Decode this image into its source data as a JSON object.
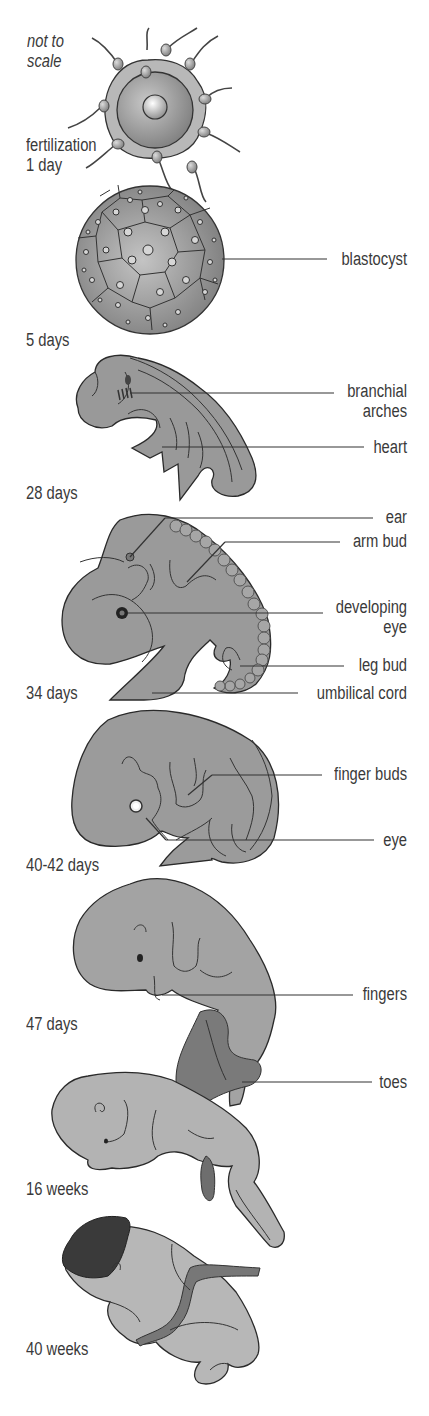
{
  "diagram": {
    "note": "not to scale",
    "note_lines": [
      "not to",
      "scale"
    ],
    "colors": {
      "tissue": "#9a9a9a",
      "tissue_light": "#b5b5b5",
      "outline": "#2a2a2a",
      "dark": "#555555",
      "hair": "#333333",
      "background": "#ffffff"
    },
    "stages": [
      {
        "id": "fertilization",
        "age_lines": [
          "fertilization",
          "1 day"
        ],
        "labels": []
      },
      {
        "id": "blastocyst-stage",
        "age": "5 days",
        "labels": [
          "blastocyst"
        ]
      },
      {
        "id": "day-28",
        "age": "28 days",
        "labels": [
          "branchial arches",
          "heart"
        ]
      },
      {
        "id": "day-34",
        "age": "34 days",
        "labels": [
          "ear",
          "arm bud",
          "developing eye",
          "leg bud",
          "umbilical cord"
        ]
      },
      {
        "id": "day-40-42",
        "age": "40-42 days",
        "labels": [
          "finger buds",
          "eye"
        ]
      },
      {
        "id": "day-47",
        "age": "47 days",
        "labels": [
          "fingers",
          "toes"
        ]
      },
      {
        "id": "week-16",
        "age": "16 weeks",
        "labels": []
      },
      {
        "id": "week-40",
        "age": "40 weeks",
        "labels": []
      }
    ],
    "text": {
      "note1": "not to",
      "note2": "scale",
      "fert1": "fertilization",
      "fert2": "1 day",
      "blastocyst": "blastocyst",
      "age5": "5 days",
      "branchial1": "branchial",
      "branchial2": "arches",
      "heart": "heart",
      "age28": "28 days",
      "ear": "ear",
      "armbud": "arm bud",
      "deveye1": "developing",
      "deveye2": "eye",
      "legbud": "leg bud",
      "cord": "umbilical cord",
      "age34": "34 days",
      "fingerbuds": "finger buds",
      "eye": "eye",
      "age40": "40-42 days",
      "fingers": "fingers",
      "age47": "47 days",
      "toes": "toes",
      "age16w": "16 weeks",
      "age40w": "40 weeks"
    }
  }
}
